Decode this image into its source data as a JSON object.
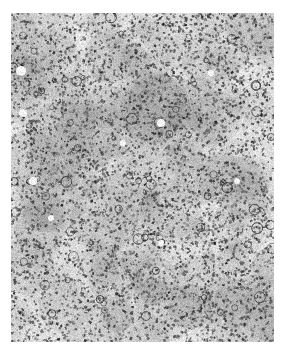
{
  "figure": {
    "tones": {
      "background": "#ffffff",
      "tissue_light": "#e6e6e6",
      "tissue_mid": "#9c9c9c",
      "nuclei_dark": "#3a3a3a"
    }
  },
  "caption": {
    "text": ""
  }
}
